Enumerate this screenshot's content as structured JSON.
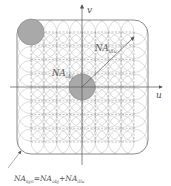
{
  "diagram": {
    "type": "fourier-pupil-synthetic-aperture",
    "axes": {
      "horizontal": "u",
      "vertical": "v"
    },
    "labels": {
      "na_illu": {
        "main": "NA",
        "sub": "illu"
      },
      "na_obj": {
        "main": "NA",
        "sub": "obj"
      },
      "equation": {
        "lhs_main": "NA",
        "lhs_sub": "syn",
        "eq": "=",
        "t1_main": "NA",
        "t1_sub": "obj",
        "plus": "+",
        "t2_main": "NA",
        "t2_sub": "illu"
      }
    },
    "colors": {
      "grid_circles": "#c8c8c8",
      "filled_circle": "#a9a9a9",
      "outline": "#8a8a8a",
      "axis": "#555555",
      "dashed": "#888888"
    },
    "grid": {
      "rows": 9,
      "cols": 9
    }
  }
}
